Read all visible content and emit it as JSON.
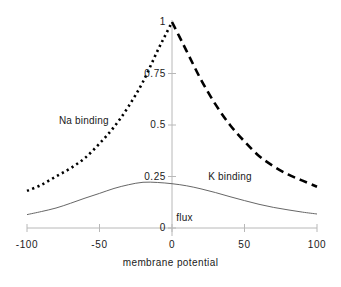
{
  "chart_data": {
    "type": "line",
    "title": "",
    "xlabel": "membrane potential",
    "ylabel": "",
    "xlim": [
      -100,
      100
    ],
    "ylim": [
      0,
      1
    ],
    "grid": false,
    "legend_position": "inline-annotations",
    "x_ticks": [
      {
        "value": -100,
        "label": "-100"
      },
      {
        "value": -50,
        "label": "-50"
      },
      {
        "value": 0,
        "label": "0"
      },
      {
        "value": 50,
        "label": "50"
      },
      {
        "value": 100,
        "label": "100"
      }
    ],
    "y_ticks": [
      {
        "value": 0,
        "label": "0"
      },
      {
        "value": 0.25,
        "label": "0.25"
      },
      {
        "value": 0.5,
        "label": "0.5"
      },
      {
        "value": 0.75,
        "label": "0.75"
      },
      {
        "value": 1,
        "label": "1"
      }
    ],
    "series": [
      {
        "name": "Na binding",
        "style": "dotted",
        "color": "#000000",
        "x": [
          -100,
          -90,
          -80,
          -70,
          -60,
          -50,
          -40,
          -30,
          -20,
          -10,
          -5,
          0
        ],
        "values": [
          0.18,
          0.21,
          0.25,
          0.29,
          0.34,
          0.41,
          0.49,
          0.59,
          0.71,
          0.86,
          0.93,
          1.0
        ]
      },
      {
        "name": "K binding",
        "style": "dashed",
        "color": "#000000",
        "x": [
          0,
          5,
          10,
          20,
          30,
          40,
          50,
          60,
          70,
          80,
          90,
          100
        ],
        "values": [
          1.0,
          0.93,
          0.86,
          0.72,
          0.6,
          0.5,
          0.42,
          0.35,
          0.3,
          0.26,
          0.23,
          0.2
        ]
      },
      {
        "name": "flux",
        "style": "solid",
        "color": "#555555",
        "x": [
          -100,
          -90,
          -80,
          -70,
          -60,
          -50,
          -40,
          -30,
          -20,
          -10,
          0,
          10,
          20,
          30,
          40,
          50,
          60,
          70,
          80,
          90,
          100
        ],
        "values": [
          0.065,
          0.08,
          0.097,
          0.12,
          0.145,
          0.168,
          0.192,
          0.21,
          0.222,
          0.221,
          0.215,
          0.205,
          0.19,
          0.172,
          0.152,
          0.133,
          0.115,
          0.1,
          0.088,
          0.077,
          0.068
        ]
      }
    ],
    "annotations": [
      {
        "text": "Na binding",
        "x": -78,
        "y": 0.545
      },
      {
        "text": "K binding",
        "x": 25,
        "y": 0.27
      },
      {
        "text": "flux",
        "x": 3,
        "y": 0.075
      }
    ]
  },
  "axis_style": {
    "axis_color": "#b4b4b4",
    "tick_color": "#b4b4b4",
    "background": "#ffffff"
  }
}
